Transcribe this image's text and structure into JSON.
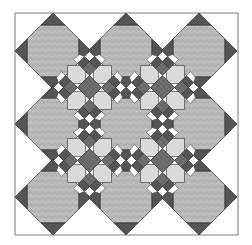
{
  "figure": {
    "title": "Quilt block layout: Snowball octagons with star sashing"
  },
  "layout": {
    "frame": {
      "x": 15,
      "y": 13,
      "width": 223,
      "height": 222
    },
    "octagon_centers_x": [
      53,
      126,
      199
    ],
    "octagon_centers_y": [
      51,
      124,
      197
    ],
    "star_centers": [
      [
        89.5,
        87.5
      ],
      [
        162.5,
        87.5
      ],
      [
        89.5,
        160.5
      ],
      [
        162.5,
        160.5
      ]
    ],
    "octagon_flat_half": 12,
    "octagon_half_extent": 26,
    "triangle_apex": 38
  },
  "colors": {
    "background": "#ffffff",
    "frame_stroke": "#7a7a7a",
    "octagon_fill": "#b9b9b9",
    "octagon_texture": "#a4a4a4",
    "dark_triangle": "#555555",
    "outline": "#2e2e2e",
    "plaid_dark": "#6b6b6b",
    "plaid_line": "#8c8c8c",
    "light_square": "#dadada",
    "white_piece": "#ffffff"
  }
}
